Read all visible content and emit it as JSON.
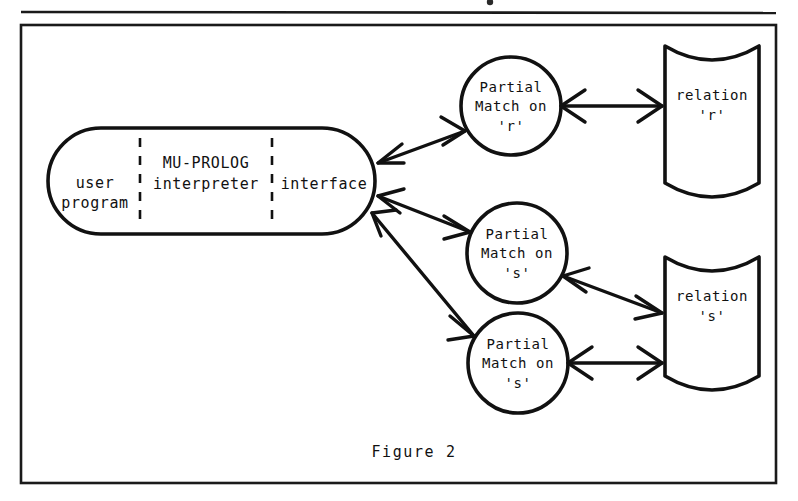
{
  "figure": {
    "caption": "Figure 2",
    "frame": {
      "x": 21,
      "y": 25,
      "width": 755,
      "height": 458
    },
    "colors": {
      "ink": "#111111",
      "paper": "#ffffff",
      "frame": "#1a1a1a"
    }
  },
  "process_box": {
    "name": "mu-prolog-system-box",
    "shape": "stadium",
    "compartments": [
      {
        "id": "user-program",
        "lines": [
          "user",
          "program"
        ]
      },
      {
        "id": "mu-prolog-interpreter",
        "lines": [
          "MU-PROLOG",
          "interpreter"
        ]
      },
      {
        "id": "interface",
        "lines": [
          "interface"
        ]
      }
    ]
  },
  "partial_match_nodes": [
    {
      "id": "partial-match-r",
      "shape": "ellipse",
      "lines": [
        "Partial",
        "Match on",
        "'r'"
      ],
      "relation": "r"
    },
    {
      "id": "partial-match-s-upper",
      "shape": "ellipse",
      "lines": [
        "Partial",
        "Match on",
        "'s'"
      ],
      "relation": "s"
    },
    {
      "id": "partial-match-s-lower",
      "shape": "ellipse",
      "lines": [
        "Partial",
        "Match on",
        "'s'"
      ],
      "relation": "s"
    }
  ],
  "relation_stores": [
    {
      "id": "relation-r",
      "shape": "database-cylinder",
      "lines": [
        "relation",
        "'r'"
      ]
    },
    {
      "id": "relation-s",
      "shape": "database-cylinder",
      "lines": [
        "relation",
        "'s'"
      ]
    }
  ],
  "connections": [
    {
      "id": "interface-to-partial-match-r",
      "from": "interface",
      "to": "partial-match-r",
      "style": "double-headed-arrow"
    },
    {
      "id": "interface-to-partial-match-s-upper",
      "from": "interface",
      "to": "partial-match-s-upper",
      "style": "double-headed-arrow"
    },
    {
      "id": "interface-to-partial-match-s-lower",
      "from": "interface",
      "to": "partial-match-s-lower",
      "style": "double-headed-arrow"
    },
    {
      "id": "partial-match-r-to-relation-r",
      "from": "partial-match-r",
      "to": "relation-r",
      "style": "double-headed-arrow"
    },
    {
      "id": "partial-match-s-upper-to-relation-s",
      "from": "partial-match-s-upper",
      "to": "relation-s",
      "style": "double-headed-arrow"
    },
    {
      "id": "partial-match-s-lower-to-relation-s",
      "from": "partial-match-s-lower",
      "to": "relation-s",
      "style": "double-headed-arrow"
    }
  ]
}
